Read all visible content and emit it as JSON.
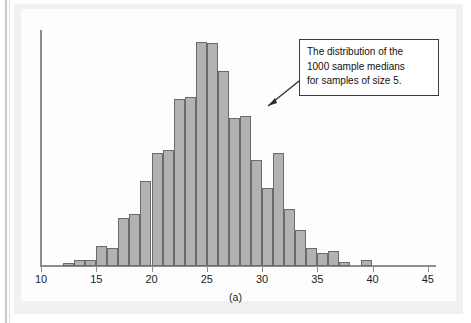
{
  "figure": {
    "caption": "(a)",
    "panel_background": "#f1f1f1",
    "plot_background": "#fdfdfd"
  },
  "annotation": {
    "name": "distribution-callout",
    "line1": "The distribution of the",
    "line2": "1000 sample medians",
    "line3": "for samples of size 5.",
    "border_color": "#3b3b3b",
    "arrow_icon": "arrow-pointer-icon"
  },
  "axis": {
    "tick_labels": [
      "10",
      "15",
      "20",
      "25",
      "30",
      "35",
      "40",
      "45"
    ],
    "tick_values": [
      10,
      15,
      20,
      25,
      30,
      35,
      40,
      45
    ],
    "axis_color": "#8d8d8d"
  },
  "style": {
    "bar_fill": "#b2b2b2",
    "bar_stroke": "#6b6b6b"
  },
  "chart_data": {
    "type": "bar",
    "title": "",
    "subtitle": "",
    "xlabel": "",
    "ylabel": "",
    "xlim": [
      10,
      45
    ],
    "ylim": [
      0,
      160
    ],
    "grid": false,
    "legend": false,
    "bin_width": 1,
    "annotations": [
      "The distribution of the 1000 sample medians for samples of size 5."
    ],
    "xtick_labels": [
      "10",
      "15",
      "20",
      "25",
      "30",
      "35",
      "40",
      "45"
    ],
    "categories": [
      12,
      13,
      14,
      15,
      16,
      17,
      18,
      19,
      20,
      21,
      22,
      23,
      24,
      25,
      26,
      27,
      28,
      29,
      30,
      31,
      32,
      33,
      34,
      35,
      36,
      37,
      39
    ],
    "values": [
      2,
      4,
      4,
      14,
      13,
      34,
      37,
      61,
      81,
      83,
      119,
      121,
      160,
      159,
      139,
      106,
      107,
      76,
      56,
      81,
      41,
      26,
      13,
      9,
      11,
      3,
      4
    ]
  }
}
